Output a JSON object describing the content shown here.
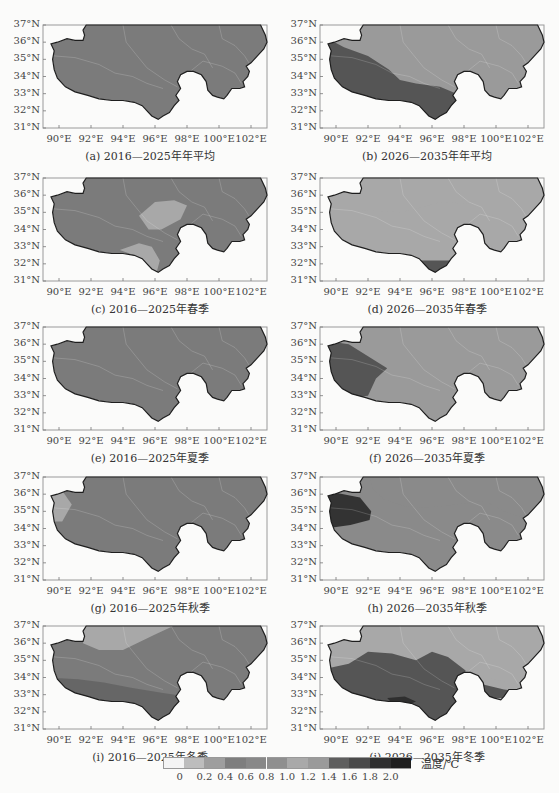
{
  "figure": {
    "panels": [
      {
        "id": "a",
        "caption": "(a) 2016—2025年年平均",
        "regions": [
          {
            "level": "0.4-0.6",
            "color": "#7b7b7b"
          }
        ]
      },
      {
        "id": "b",
        "caption": "(b) 2026—2035年年平均",
        "regions": [
          {
            "level": "1.0-1.2",
            "color": "#9a9a9a"
          },
          {
            "level": "1.4-1.6",
            "color": "#555555"
          }
        ]
      },
      {
        "id": "c",
        "caption": "(c) 2016—2025年春季",
        "regions": [
          {
            "level": "0.4-0.6",
            "color": "#7b7b7b"
          },
          {
            "level": "0.2-0.4",
            "color": "#a8a8a8"
          }
        ]
      },
      {
        "id": "d",
        "caption": "(d) 2026—2035年春季",
        "regions": [
          {
            "level": "1.0-1.2",
            "color": "#a8a8a8"
          },
          {
            "level": "1.2-1.4",
            "color": "#8a8a8a"
          },
          {
            "level": "1.4-1.6",
            "color": "#555555"
          }
        ]
      },
      {
        "id": "e",
        "caption": "(e) 2016—2025年夏季",
        "regions": [
          {
            "level": "0.4-0.6",
            "color": "#7b7b7b"
          }
        ]
      },
      {
        "id": "f",
        "caption": "(f) 2026—2035年夏季",
        "regions": [
          {
            "level": "1.0-1.2",
            "color": "#9a9a9a"
          },
          {
            "level": "1.4-1.6",
            "color": "#555555"
          }
        ]
      },
      {
        "id": "g",
        "caption": "(g) 2016—2025年秋季",
        "regions": [
          {
            "level": "0.4-0.6",
            "color": "#7b7b7b"
          },
          {
            "level": "0.2-0.4",
            "color": "#a8a8a8"
          }
        ]
      },
      {
        "id": "h",
        "caption": "(h) 2026—2035年秋季",
        "regions": [
          {
            "level": "1.2-1.4",
            "color": "#8a8a8a"
          },
          {
            "level": "1.4-1.6",
            "color": "#5a5a5a"
          },
          {
            "level": "1.8-2.0",
            "color": "#333333"
          }
        ]
      },
      {
        "id": "i",
        "caption": "(i) 2016—2025年冬季",
        "regions": [
          {
            "level": "0.6-0.8",
            "color": "#7b7b7b"
          },
          {
            "level": "0.8-1.0",
            "color": "#666666"
          },
          {
            "level": "0.2-0.4",
            "color": "#a8a8a8"
          }
        ]
      },
      {
        "id": "j",
        "caption": "(j) 2026—2035年冬季",
        "regions": [
          {
            "level": "1.0-1.2",
            "color": "#a8a8a8"
          },
          {
            "level": "1.2-1.4",
            "color": "#8a8a8a"
          },
          {
            "level": "1.4-1.6",
            "color": "#555555"
          },
          {
            "level": "1.8-2.0",
            "color": "#2f2f2f"
          }
        ]
      }
    ],
    "y_ticks": [
      "37°N",
      "36°N",
      "35°N",
      "34°N",
      "33°N",
      "32°N",
      "31°N"
    ],
    "x_ticks": [
      "90°E",
      "92°E",
      "94°E",
      "96°E",
      "98°E",
      "100°E",
      "102°E"
    ]
  },
  "legend": {
    "title": "温度/℃",
    "ticks": [
      "0",
      "0.2",
      "0.4",
      "0.6",
      "0.8",
      "1.0",
      "1.2",
      "1.4",
      "1.6",
      "1.8",
      "2.0"
    ],
    "colors": [
      "#f4f4f4",
      "#bdbdbd",
      "#9e9e9e",
      "#7e7e7e",
      "#888888",
      "#8f8f8f",
      "#a9a9a9",
      "#9a9a9a",
      "#5e5e5e",
      "#4a4a4a",
      "#2f2f2f",
      "#1f1f1f"
    ]
  }
}
